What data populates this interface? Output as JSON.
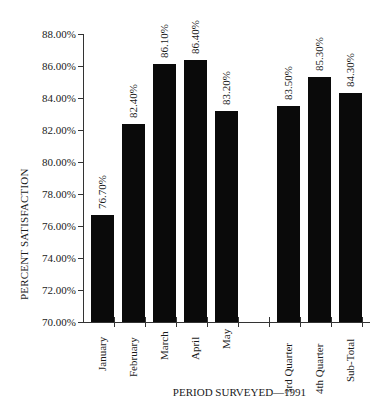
{
  "chart_data": {
    "type": "bar",
    "title": "",
    "xlabel": "PERIOD SURVEYED—1991",
    "ylabel": "PERCENT SATISFACTION",
    "ylim": [
      70,
      88
    ],
    "yticks": [
      "70.00%",
      "72.00%",
      "74.00%",
      "76.00%",
      "78.00%",
      "80.00%",
      "82.00%",
      "84.00%",
      "86.00%",
      "88.00%"
    ],
    "grid": false,
    "legend": null,
    "categories": [
      "January",
      "February",
      "March",
      "April",
      "May",
      "",
      "3rd Quarter",
      "4th Quarter",
      "Sub-Total"
    ],
    "values": [
      76.7,
      82.4,
      86.1,
      86.4,
      83.2,
      null,
      83.5,
      85.3,
      84.3
    ],
    "value_labels": [
      "76.70%",
      "82.40%",
      "86.10%",
      "86.40%",
      "83.20%",
      "",
      "83.50%",
      "85.30%",
      "84.30%"
    ],
    "bar_color": "#0a0a0a"
  }
}
